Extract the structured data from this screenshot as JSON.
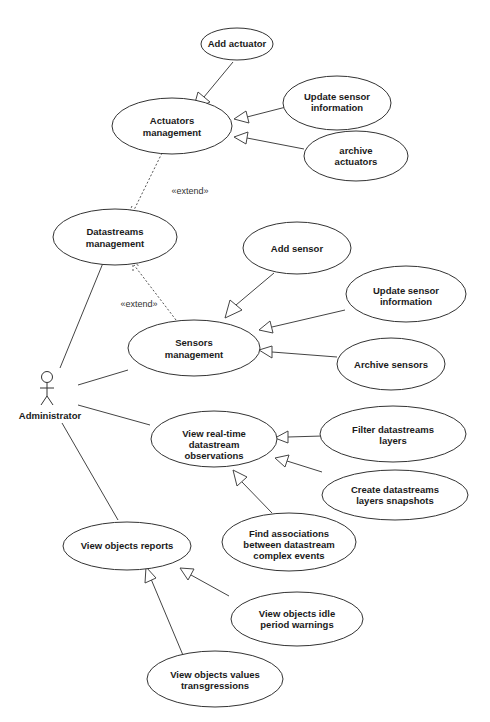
{
  "diagram": {
    "type": "UML use case diagram",
    "actor": {
      "label": "Administrator"
    },
    "stereotypes": {
      "extend_1": "«extend»",
      "extend_2": "«extend»"
    },
    "use_cases": {
      "add_actuator": [
        "Add actuator"
      ],
      "actuators_management": [
        "Actuators",
        "management"
      ],
      "update_sensor_info_1": [
        "Update sensor",
        "information"
      ],
      "archive_actuators": [
        "archive",
        "actuators"
      ],
      "datastreams_management": [
        "Datastreams",
        "management"
      ],
      "add_sensor": [
        "Add sensor"
      ],
      "update_sensor_info_2": [
        "Update sensor",
        "information"
      ],
      "sensors_management": [
        "Sensors",
        "management"
      ],
      "archive_sensors": [
        "Archive sensors"
      ],
      "view_realtime": [
        "View real-time",
        "datastream",
        "observations"
      ],
      "filter_layers": [
        "Filter datastreams",
        "layers"
      ],
      "create_snapshots": [
        "Create datastreams",
        "layers snapshots"
      ],
      "find_associations": [
        "Find associations",
        "between datastream",
        "complex events"
      ],
      "view_reports": [
        "View objects reports"
      ],
      "idle_warnings": [
        "View objects idle",
        "period warnings"
      ],
      "values_transgressions": [
        "View objects values",
        "transgressions"
      ]
    }
  }
}
